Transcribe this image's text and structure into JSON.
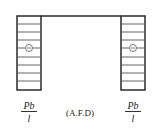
{
  "diagram": {
    "type": "axial-force-diagram",
    "caption": "(A.F.D)",
    "colors": {
      "line": "#2a2a2a",
      "hatch": "#555555",
      "background": "#ffffff"
    },
    "frame": {
      "top_beam": {
        "x1": 41,
        "x2": 121,
        "y": 16
      }
    },
    "columns": [
      {
        "name": "left",
        "x": 17,
        "y": 16,
        "width": 24,
        "height": 74,
        "sign": "−",
        "label_numerator": "Pb",
        "label_denominator": "l"
      },
      {
        "name": "right",
        "x": 121,
        "y": 16,
        "width": 24,
        "height": 74,
        "sign": "−",
        "label_numerator": "Pb",
        "label_denominator": "l"
      }
    ],
    "hatch_spacing": 8
  }
}
